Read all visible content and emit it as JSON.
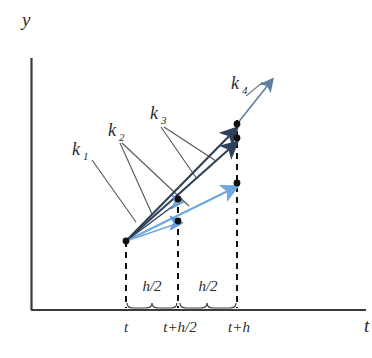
{
  "figure": {
    "axes": {
      "y_label": "y",
      "x_label": "t",
      "x_axis_y": 310,
      "y_axis_x": 31,
      "y_axis_top": 58,
      "x_axis_right": 366
    },
    "colors": {
      "axis": "#3a3a3a",
      "dark_arrow": "#2e4158",
      "light_arrow": "#6fa8dc",
      "k4_arrow": "#5e7f9e",
      "leader_line": "#555555",
      "dot": "#111111",
      "dashed": "#111111",
      "text": "#2b2b2b"
    },
    "ticks": [
      {
        "name": "t",
        "label": "t",
        "x": 126
      },
      {
        "name": "t-plus-h-half",
        "label": "t+h/2",
        "x": 178
      },
      {
        "name": "t-plus-h",
        "label": "t+h",
        "x": 237
      }
    ],
    "spans": [
      {
        "name": "first-half-step",
        "label": "h/2",
        "x_start": 126,
        "x_end": 178,
        "label_x": 152,
        "label_y": 288
      },
      {
        "name": "second-half-step",
        "label": "h/2",
        "x_start": 178,
        "x_end": 237,
        "label_x": 207,
        "label_y": 288
      }
    ],
    "slope_labels": [
      {
        "name": "k1",
        "base": "k",
        "sub": "1",
        "x": 72,
        "y": 155
      },
      {
        "name": "k2",
        "base": "k",
        "sub": "2",
        "x": 108,
        "y": 136
      },
      {
        "name": "k3",
        "base": "k",
        "sub": "3",
        "x": 152,
        "y": 117
      },
      {
        "name": "k4",
        "base": "k",
        "sub": "4",
        "x": 231,
        "y": 89
      }
    ],
    "start_point": {
      "x": 126,
      "y": 241
    },
    "dots": [
      {
        "name": "dot-origin",
        "x": 126,
        "y": 241
      },
      {
        "name": "dot-mid-lower",
        "x": 178,
        "y": 219
      },
      {
        "name": "dot-mid-upper",
        "x": 178,
        "y": 198
      },
      {
        "name": "dot-end-light",
        "x": 237,
        "y": 182
      },
      {
        "name": "dot-end-mid",
        "x": 237,
        "y": 138
      },
      {
        "name": "dot-end-upper",
        "x": 237,
        "y": 124
      }
    ],
    "vectors": [
      {
        "name": "k1-light-arrow",
        "color": "light",
        "x1": 126,
        "y1": 241,
        "x2": 180,
        "y2": 220
      },
      {
        "name": "k2-dark-arrow",
        "color": "dark",
        "x1": 126,
        "y1": 241,
        "x2": 181,
        "y2": 199
      },
      {
        "name": "k2-dark-long",
        "color": "dark",
        "x1": 126,
        "y1": 241,
        "x2": 240,
        "y2": 139
      },
      {
        "name": "k3-dark-long",
        "color": "dark",
        "x1": 126,
        "y1": 241,
        "x2": 240,
        "y2": 125
      },
      {
        "name": "k3-light-arrow",
        "color": "light",
        "x1": 126,
        "y1": 241,
        "x2": 240,
        "y2": 183
      },
      {
        "name": "k4-arrow",
        "color": "k4",
        "x1": 237,
        "y1": 124,
        "x2": 276,
        "y2": 75
      }
    ],
    "leaders": [
      {
        "name": "leader-k1",
        "points": "92,160 136,222"
      },
      {
        "name": "leader-k2-a",
        "points": "120,143 152,214"
      },
      {
        "name": "leader-k2-b",
        "points": "122,143 188,205"
      },
      {
        "name": "leader-k3-a",
        "points": "162,126 196,178"
      },
      {
        "name": "leader-k3-b",
        "points": "164,126 214,160"
      },
      {
        "name": "leader-k4",
        "points": "245,96 262,83"
      }
    ]
  }
}
